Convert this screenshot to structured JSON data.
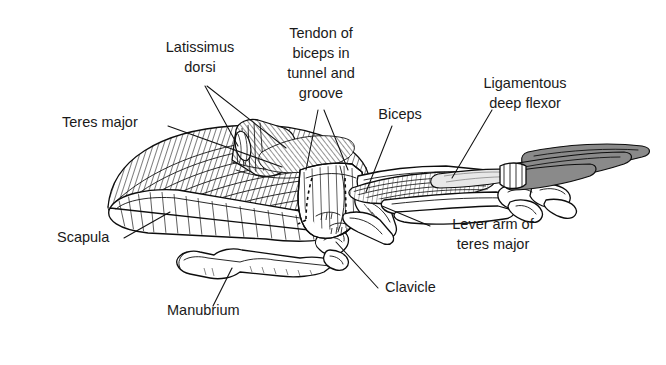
{
  "figure": {
    "background_color": "#ffffff",
    "ink_color": "#111111",
    "accent_fill": "#8a8a8a",
    "width": 666,
    "height": 365
  },
  "labels": [
    {
      "id": "latissimus-dorsi",
      "lines": [
        "Latissimus",
        "dorsi"
      ],
      "line1": "Latissimus",
      "line2": "dorsi",
      "x": 200,
      "y": 52,
      "align": "middle"
    },
    {
      "id": "tendon-of-biceps",
      "lines": [
        "Tendon of",
        "biceps in",
        "tunnel and",
        "groove"
      ],
      "line1": "Tendon of",
      "line2": "biceps in",
      "line3": "tunnel and",
      "line4": "groove",
      "x": 321,
      "y": 38,
      "align": "middle"
    },
    {
      "id": "ligamentous-deep-flexor",
      "lines": [
        "Ligamentous",
        "deep flexor"
      ],
      "line1": "Ligamentous",
      "line2": "deep flexor",
      "x": 525,
      "y": 88,
      "align": "middle"
    },
    {
      "id": "teres-major",
      "lines": [
        "Teres major"
      ],
      "line1": "Teres major",
      "x": 62,
      "y": 127,
      "align": "start"
    },
    {
      "id": "biceps",
      "lines": [
        "Biceps"
      ],
      "line1": "Biceps",
      "x": 400,
      "y": 119,
      "align": "middle"
    },
    {
      "id": "scapula",
      "lines": [
        "Scapula"
      ],
      "line1": "Scapula",
      "x": 57,
      "y": 242,
      "align": "start"
    },
    {
      "id": "lever-arm-of-teres-major",
      "lines": [
        "Lever arm of",
        "teres major"
      ],
      "line1": "Lever arm of",
      "line2": "teres major",
      "x": 493,
      "y": 229,
      "align": "middle"
    },
    {
      "id": "clavicle",
      "lines": [
        "Clavicle"
      ],
      "line1": "Clavicle",
      "x": 385,
      "y": 292,
      "align": "start"
    },
    {
      "id": "manubrium",
      "lines": [
        "Manubrium"
      ],
      "line1": "Manubrium",
      "x": 167,
      "y": 315,
      "align": "start"
    }
  ],
  "structures": [
    {
      "id": "teres-major-muscle",
      "name": "Teres major muscle belly",
      "style": "hatched"
    },
    {
      "id": "latissimus-dorsi-stub",
      "name": "Latissimus dorsi cut stub",
      "style": "hatched"
    },
    {
      "id": "scapula-bone",
      "name": "Scapula",
      "style": "outline-hatched"
    },
    {
      "id": "manubrium-bone",
      "name": "Manubrium of sternum",
      "style": "outline"
    },
    {
      "id": "clavicle-bone",
      "name": "Clavicle (furcula)",
      "style": "outline"
    },
    {
      "id": "humerus-bone",
      "name": "Humerus with deltopectoral crest",
      "style": "outline"
    },
    {
      "id": "biceps-muscle",
      "name": "Biceps muscle",
      "style": "hatched"
    },
    {
      "id": "radius-ulna",
      "name": "Radius and ulna",
      "style": "outline"
    },
    {
      "id": "carpometacarpus",
      "name": "Carpus and manus bones",
      "style": "outline"
    },
    {
      "id": "deep-flexor-ligament",
      "name": "Ligamentous deep flexor",
      "style": "outline"
    },
    {
      "id": "primary-feather-quills",
      "name": "Primary feather quills",
      "style": "gray-filled"
    },
    {
      "id": "biceps-tendon-path",
      "name": "Tendon of biceps path",
      "style": "dashed"
    }
  ]
}
